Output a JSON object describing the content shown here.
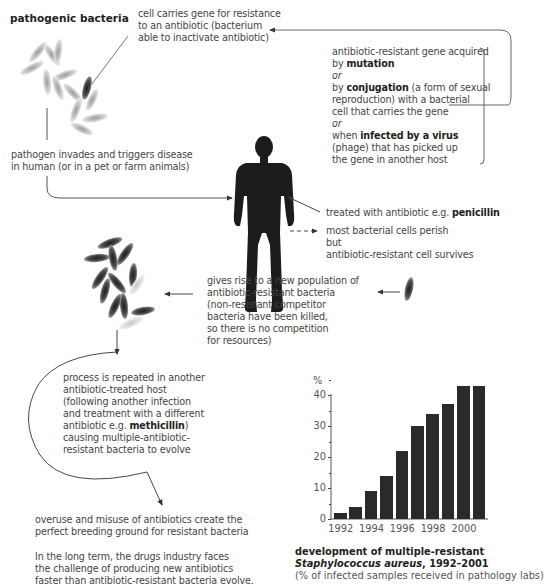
{
  "title": "pathogenic bacteria",
  "labels": {
    "resistant_cell": [
      "cell carries gene for resistance",
      "to an antibiotic (bacterium",
      "able to inactivate antibiotic)"
    ],
    "gene_acquired": {
      "l1": "antibiotic-resistant gene acquired",
      "l2_pre": "by ",
      "l2_bold": "mutation",
      "or1": "or",
      "l4_pre": "by ",
      "l4_bold": "conjugation",
      "l4_post": " (a form of sexual",
      "l5": "reproduction) with a bacterial",
      "l6": "cell that carries the gene",
      "or2": "or",
      "l8_pre": "when ",
      "l8_bold": "infected by a virus",
      "l9": "(phage) that has picked up",
      "l10": "the gene in another host"
    },
    "pathogen_invades": [
      "pathogen invades and triggers disease",
      "in human (or in a pet or farm animals)"
    ],
    "treated": {
      "pre": "treated with antibiotic e.g. ",
      "bold": "penicillin"
    },
    "perish": [
      "most bacterial cells perish",
      "but",
      "antibiotic-resistant cell survives"
    ],
    "new_population": [
      "gives rise to a new population of",
      "antibiotic-resistant bacteria",
      "(non-resistant competitor",
      "bacteria have been killed,",
      "so there is no competition",
      "for resources)"
    ],
    "process_repeated": {
      "lines": [
        "process is repeated in another",
        "antibiotic-treated host",
        "(following another infection",
        "and treatment with a different"
      ],
      "l5_pre": "antibiotic e.g. ",
      "l5_bold": "methicillin",
      "l5_post": ")",
      "l6": "causing multiple-antibiotic-",
      "l7": "resistant bacteria to evolve"
    },
    "overuse": [
      "overuse and misuse of antibiotics create the",
      "perfect breeding ground for resistant bacteria"
    ],
    "long_term": [
      "In the long term, the drugs industry faces",
      "the challenge of producing new antibiotics",
      "faster than antibiotic-resistant bacteria evolve."
    ]
  },
  "chart_caption": {
    "l1": "development of multiple-resistant",
    "l2_italic": "Staphylococcus aureus",
    "l2_rest": ", 1992–2001",
    "l3": "(% of infected samples received in pathology labs)"
  },
  "chart_data": {
    "type": "bar",
    "title": "development of multiple-resistant Staphylococcus aureus, 1992–2001",
    "subtitle": "(% of infected samples received in pathology labs)",
    "xlabel": "",
    "ylabel": "%",
    "categories": [
      "1992",
      "1993",
      "1994",
      "1995",
      "1996",
      "1997",
      "1998",
      "1999",
      "2000",
      "2001"
    ],
    "values": [
      2,
      4,
      9,
      14,
      22,
      30,
      34,
      37,
      43,
      43
    ],
    "x_tick_labels": [
      "1992",
      "1994",
      "1996",
      "1998",
      "2000"
    ],
    "y_tick_labels": [
      "0",
      "10",
      "20",
      "30",
      "40"
    ],
    "ylim": [
      0,
      45
    ],
    "grid": false,
    "bar_color": "#2a2a2a"
  }
}
